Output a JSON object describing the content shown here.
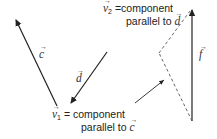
{
  "diagram": {
    "vectors": [
      {
        "id": "c",
        "label": "c"
      },
      {
        "id": "d",
        "label": "d"
      },
      {
        "id": "f",
        "label": "f"
      }
    ],
    "annotations": {
      "v2": {
        "symbol": "v",
        "subscript": "2",
        "text_line1": " =component",
        "text_line2": "parallel to ",
        "ref": "d"
      },
      "v1": {
        "symbol": "v",
        "subscript": "1",
        "text_line1": " = component",
        "text_line2": "parallel to ",
        "ref": "c"
      }
    },
    "colors": {
      "solid": "#222222",
      "dashed": "#555555"
    }
  }
}
